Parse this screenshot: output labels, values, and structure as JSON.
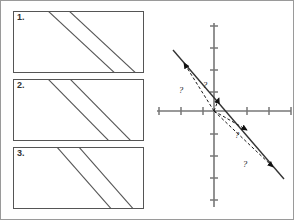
{
  "figure": {
    "background_color": "#ffffff",
    "border_color": "#9a9a9a",
    "line_color": "#555555",
    "axis_color": "#777777",
    "vector_color": "#1a1a1a"
  },
  "left_panel": {
    "name": "strata-panel",
    "boxes": [
      {
        "label": "1.",
        "x": 12,
        "y": 10,
        "width": 131,
        "height": 62,
        "lines": [
          {
            "x1": 33,
            "y1": -2,
            "x2": 104,
            "y2": 64
          },
          {
            "x1": 54,
            "y1": -2,
            "x2": 125,
            "y2": 64
          }
        ]
      },
      {
        "label": "2.",
        "x": 12,
        "y": 78,
        "width": 131,
        "height": 62,
        "lines": [
          {
            "x1": 33,
            "y1": -2,
            "x2": 98,
            "y2": 64
          },
          {
            "x1": 55,
            "y1": -2,
            "x2": 120,
            "y2": 64
          }
        ]
      },
      {
        "label": "3.",
        "x": 12,
        "y": 146,
        "width": 131,
        "height": 62,
        "lines": [
          {
            "x1": 42,
            "y1": -2,
            "x2": 100,
            "y2": 64
          },
          {
            "x1": 64,
            "y1": -2,
            "x2": 122,
            "y2": 64
          }
        ]
      }
    ]
  },
  "chart_data": {
    "type": "scatter",
    "title": "",
    "xlabel": "",
    "ylabel": "",
    "grid": false,
    "legend": "none",
    "origin_px": {
      "x": 63,
      "y": 110
    },
    "axes": {
      "x_axis": {
        "x1": 6,
        "y1": 110,
        "x2": 140,
        "y2": 110
      },
      "y_axis": {
        "x1": 63,
        "y1": 22,
        "x2": 63,
        "y2": 206
      },
      "x_tick_spacing_px": 22,
      "y_tick_spacing_px": 22,
      "x_ticks_px": [
        8,
        30,
        52,
        96,
        118,
        140
      ],
      "y_ticks_px": [
        25,
        47,
        69,
        91,
        133,
        155,
        177,
        199
      ],
      "tick_len_px": 8
    },
    "line": {
      "name": "target-line",
      "x1": 22,
      "y1": 49,
      "x2": 133,
      "y2": 178,
      "slope_description": "negative slope",
      "style": "solid"
    },
    "vectors": [
      {
        "id": "v1",
        "label": "?",
        "tip_x": 33,
        "tip_y": 62,
        "label_x": 30,
        "label_y": 92
      },
      {
        "id": "v2",
        "label": "?",
        "tip_x": 68,
        "tip_y": 97,
        "label_x": 54,
        "label_y": 87
      },
      {
        "id": "v3",
        "label": "?",
        "tip_x": 96,
        "tip_y": 129,
        "label_x": 86,
        "label_y": 137
      },
      {
        "id": "v4",
        "label": "?",
        "tip_x": 122,
        "tip_y": 166,
        "label_x": 94,
        "label_y": 166
      }
    ],
    "annotations": [
      "?",
      "?",
      "?",
      "?"
    ]
  }
}
